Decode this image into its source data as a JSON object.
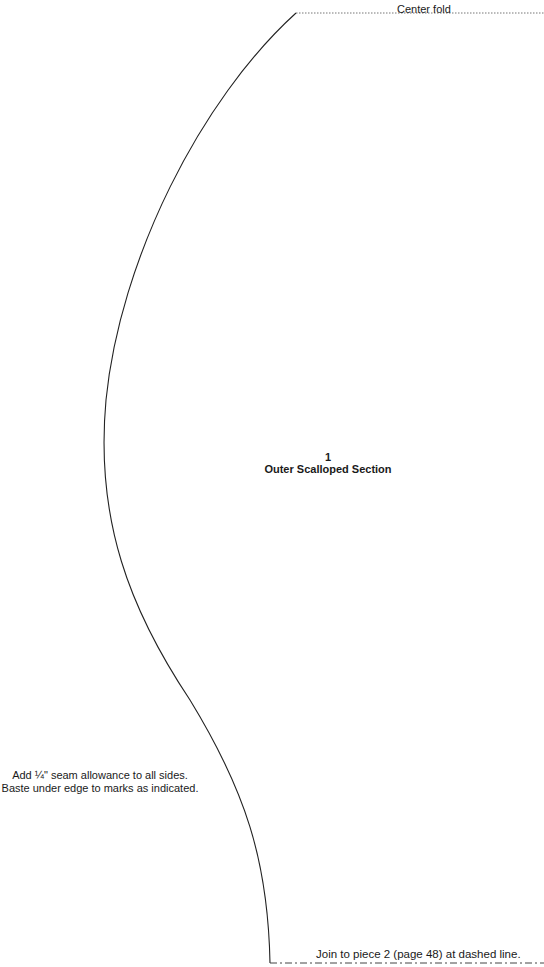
{
  "pattern": {
    "fold_label": "Center fold",
    "piece_number": "1",
    "piece_name": "Outer Scalloped Section",
    "notes": [
      "Add ¼\" seam allowance to all sides.",
      "Baste under edge to marks as indicated."
    ],
    "join_label": "Join to piece 2 (page 48) at dashed line.",
    "line_color": "#222222",
    "fold_line_style": "dotted",
    "join_line_style": "dash-dot"
  }
}
